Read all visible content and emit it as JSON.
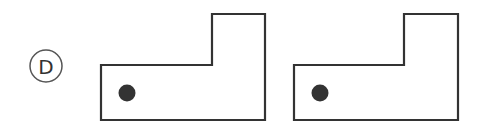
{
  "option": {
    "label": "D",
    "circle_color": "#444444"
  },
  "figures": [
    {
      "name": "figure-left",
      "shape": "L-shape",
      "dot": "bottom-left"
    },
    {
      "name": "figure-right",
      "shape": "L-shape",
      "dot": "bottom-left"
    }
  ],
  "colors": {
    "stroke": "#333333",
    "dot": "#333333",
    "background": "#ffffff"
  }
}
